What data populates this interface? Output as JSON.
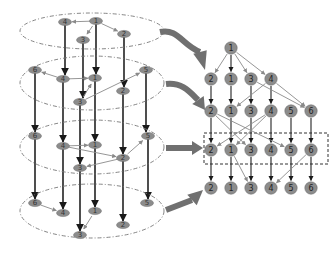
{
  "colors": {
    "background": "#ffffff",
    "node_fill": "#8c8c8c",
    "node_stroke": "#6e6e6e",
    "strong_edge": "#222222",
    "weak_edge": "#8a8a8a",
    "ellipse_stroke": "#777777",
    "big_arrow": "#707070",
    "box_stroke": "#333333"
  },
  "left_cylinder": {
    "layers": [
      {
        "ellipse": {
          "cx": 92,
          "cy": 31,
          "rx": 72,
          "ry": 18
        },
        "nodes": [
          {
            "label": "4",
            "x": 65,
            "y": 22
          },
          {
            "label": "1",
            "x": 96,
            "y": 21
          },
          {
            "label": "3",
            "x": 83,
            "y": 40
          },
          {
            "label": "2",
            "x": 124,
            "y": 34
          }
        ],
        "edges": [
          {
            "from": "1",
            "to": "4"
          },
          {
            "from": "1",
            "to": "3"
          },
          {
            "from": "1",
            "to": "2"
          }
        ]
      },
      {
        "ellipse": {
          "cx": 92,
          "cy": 83,
          "rx": 72,
          "ry": 27
        },
        "nodes": [
          {
            "label": "6",
            "x": 35,
            "y": 70
          },
          {
            "label": "4",
            "x": 63,
            "y": 79
          },
          {
            "label": "1",
            "x": 95,
            "y": 78
          },
          {
            "label": "5",
            "x": 146,
            "y": 70
          },
          {
            "label": "2",
            "x": 123,
            "y": 91
          },
          {
            "label": "3",
            "x": 80,
            "y": 102
          }
        ],
        "edges": [
          {
            "from": "4",
            "to": "6"
          },
          {
            "from": "4",
            "to": "1"
          },
          {
            "from": "3",
            "to": "1"
          },
          {
            "from": "3",
            "to": "5"
          }
        ]
      },
      {
        "ellipse": {
          "cx": 92,
          "cy": 147,
          "rx": 72,
          "ry": 27
        },
        "nodes": [
          {
            "label": "6",
            "x": 35,
            "y": 136
          },
          {
            "label": "4",
            "x": 63,
            "y": 146
          },
          {
            "label": "1",
            "x": 95,
            "y": 145
          },
          {
            "label": "5",
            "x": 148,
            "y": 136
          },
          {
            "label": "2",
            "x": 123,
            "y": 158
          },
          {
            "label": "3",
            "x": 80,
            "y": 168
          }
        ],
        "edges": [
          {
            "from": "4",
            "to": "1"
          },
          {
            "from": "4",
            "to": "2"
          },
          {
            "from": "2",
            "to": "5"
          },
          {
            "from": "2",
            "to": "3"
          }
        ]
      },
      {
        "ellipse": {
          "cx": 92,
          "cy": 211,
          "rx": 72,
          "ry": 27
        },
        "nodes": [
          {
            "label": "6",
            "x": 35,
            "y": 203
          },
          {
            "label": "4",
            "x": 63,
            "y": 213
          },
          {
            "label": "1",
            "x": 95,
            "y": 211
          },
          {
            "label": "5",
            "x": 147,
            "y": 203
          },
          {
            "label": "2",
            "x": 123,
            "y": 225
          },
          {
            "label": "3",
            "x": 80,
            "y": 235
          }
        ],
        "edges": [
          {
            "from": "6",
            "to": "4"
          },
          {
            "from": "1",
            "to": "3"
          }
        ]
      }
    ],
    "vertical_lines": [
      {
        "x": 65,
        "y1": 25,
        "y2": 75
      },
      {
        "x": 96,
        "y1": 24,
        "y2": 74
      },
      {
        "x": 83,
        "y1": 43,
        "y2": 98
      },
      {
        "x": 124,
        "y1": 37,
        "y2": 87
      },
      {
        "x": 35,
        "y1": 73,
        "y2": 132
      },
      {
        "x": 63,
        "y1": 82,
        "y2": 142
      },
      {
        "x": 95,
        "y1": 81,
        "y2": 141
      },
      {
        "x": 146,
        "y1": 73,
        "y2": 132
      },
      {
        "x": 123,
        "y1": 94,
        "y2": 154
      },
      {
        "x": 80,
        "y1": 105,
        "y2": 164
      },
      {
        "x": 35,
        "y1": 139,
        "y2": 199
      },
      {
        "x": 63,
        "y1": 149,
        "y2": 209
      },
      {
        "x": 95,
        "y1": 148,
        "y2": 207
      },
      {
        "x": 148,
        "y1": 139,
        "y2": 199
      },
      {
        "x": 123,
        "y1": 161,
        "y2": 221
      },
      {
        "x": 80,
        "y1": 171,
        "y2": 231
      }
    ]
  },
  "right_graph": {
    "root": {
      "label": "1",
      "x": 231,
      "y": 48
    },
    "rows": [
      {
        "y": 79,
        "nodes": [
          {
            "label": "2",
            "x": 211
          },
          {
            "label": "1",
            "x": 231
          },
          {
            "label": "3",
            "x": 251
          },
          {
            "label": "4",
            "x": 271
          }
        ]
      },
      {
        "y": 111,
        "nodes": [
          {
            "label": "2",
            "x": 211
          },
          {
            "label": "1",
            "x": 231
          },
          {
            "label": "3",
            "x": 251
          },
          {
            "label": "4",
            "x": 271
          },
          {
            "label": "5",
            "x": 291
          },
          {
            "label": "6",
            "x": 311
          }
        ]
      },
      {
        "y": 150,
        "nodes": [
          {
            "label": "2",
            "x": 211
          },
          {
            "label": "1",
            "x": 231
          },
          {
            "label": "3",
            "x": 251
          },
          {
            "label": "4",
            "x": 271
          },
          {
            "label": "5",
            "x": 291
          },
          {
            "label": "6",
            "x": 311
          }
        ]
      },
      {
        "y": 188,
        "nodes": [
          {
            "label": "2",
            "x": 211
          },
          {
            "label": "1",
            "x": 231
          },
          {
            "label": "3",
            "x": 251
          },
          {
            "label": "4",
            "x": 271
          },
          {
            "label": "5",
            "x": 291
          },
          {
            "label": "6",
            "x": 311
          }
        ]
      }
    ],
    "dashed_box": {
      "x": 204,
      "y": 133,
      "width": 124,
      "height": 31
    }
  },
  "big_arrows": [
    {
      "name": "arrow-layer-1",
      "path": "M160,32 C178,28 182,45 200,52",
      "head": [
        205,
        70
      ]
    },
    {
      "name": "arrow-layer-2",
      "path": "M166,84 C182,82 190,92 198,100",
      "head": [
        205,
        110
      ]
    },
    {
      "name": "arrow-layer-3",
      "path": "M166,148 L192,148",
      "head": [
        203,
        148
      ]
    },
    {
      "name": "arrow-layer-4",
      "path": "M166,210 L192,200",
      "head": [
        203,
        190
      ]
    }
  ]
}
